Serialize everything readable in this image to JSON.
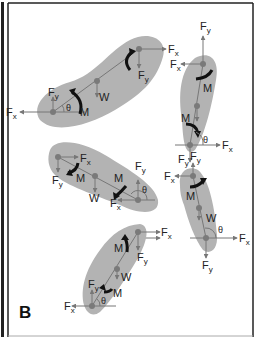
{
  "figure": {
    "panel_label": "B",
    "colors": {
      "segment_fill": "#b3b3b3",
      "line": "#777777",
      "joint": "#7a7a7a",
      "moment_arrow": "#111111",
      "frame": "#222222"
    },
    "labels": {
      "fx": "F",
      "fx_sub": "x",
      "fy": "F",
      "fy_sub": "y",
      "weight": "W",
      "moment": "M",
      "angle": "θ"
    },
    "segments": [
      {
        "name": "segment-1",
        "proximal": [
          53,
          112
        ],
        "center": [
          97,
          81
        ],
        "distal": [
          139,
          49
        ]
      },
      {
        "name": "segment-2",
        "proximal": [
          203,
          64
        ],
        "center": [
          197,
          106
        ],
        "distal": [
          190,
          145
        ]
      },
      {
        "name": "segment-3",
        "proximal": [
          58,
          157
        ],
        "center": [
          95,
          176
        ],
        "distal": [
          138,
          200
        ]
      },
      {
        "name": "segment-4",
        "proximal": [
          193,
          176
        ],
        "center": [
          199,
          208
        ],
        "distal": [
          206,
          238
        ]
      },
      {
        "name": "segment-5",
        "proximal": [
          138,
          232
        ],
        "center": [
          117,
          269
        ],
        "distal": [
          92,
          306
        ]
      }
    ]
  }
}
